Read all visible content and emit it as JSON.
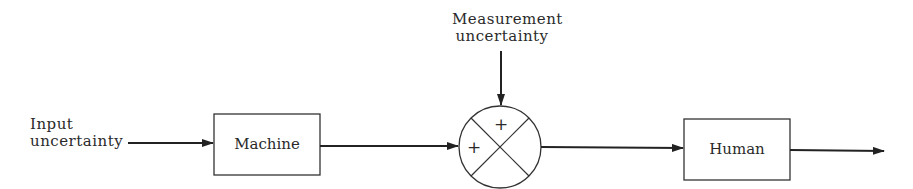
{
  "diagram": {
    "type": "block-diagram",
    "nodes": {
      "input": {
        "line1": "Input",
        "line2": "uncertainty"
      },
      "machine": {
        "label": "Machine"
      },
      "measurement": {
        "line1": "Measurement",
        "line2": "uncertainty"
      },
      "summing_junction": {
        "top_sign": "+",
        "left_sign": "+"
      },
      "human": {
        "label": "Human"
      }
    },
    "edges": [
      {
        "from": "input",
        "to": "machine"
      },
      {
        "from": "machine",
        "to": "summing_junction"
      },
      {
        "from": "measurement",
        "to": "summing_junction"
      },
      {
        "from": "summing_junction",
        "to": "human"
      },
      {
        "from": "human",
        "to": "output"
      }
    ],
    "colors": {
      "stroke": "#222222",
      "background": "#ffffff"
    }
  }
}
